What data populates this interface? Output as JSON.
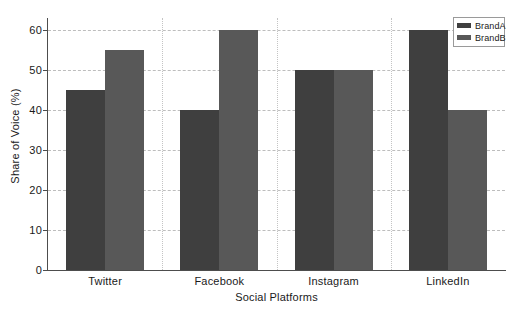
{
  "chart_data": {
    "type": "bar",
    "title": "",
    "xlabel": "Social Platforms",
    "ylabel": "Share of Voice (%)",
    "categories": [
      "Twitter",
      "Facebook",
      "Instagram",
      "LinkedIn"
    ],
    "series": [
      {
        "name": "BrandA",
        "values": [
          45,
          40,
          50,
          60
        ],
        "color": "#3f3f3f"
      },
      {
        "name": "BrandB",
        "values": [
          55,
          60,
          50,
          40
        ],
        "color": "#585858"
      }
    ],
    "ylim": [
      0,
      63
    ],
    "yticks": [
      0,
      10,
      20,
      30,
      40,
      50,
      60
    ],
    "ytick_labels": [
      "0",
      "10",
      "20",
      "30",
      "40",
      "50",
      "60"
    ],
    "grid": true,
    "grid_axis": "both",
    "grid_style": "dashed",
    "legend_position": "upper right",
    "legend_entries": [
      "BrandA",
      "BrandB"
    ],
    "background": "#ffffff",
    "axis_color": "#4d4d4d",
    "grid_color": "#bdbdbd"
  }
}
